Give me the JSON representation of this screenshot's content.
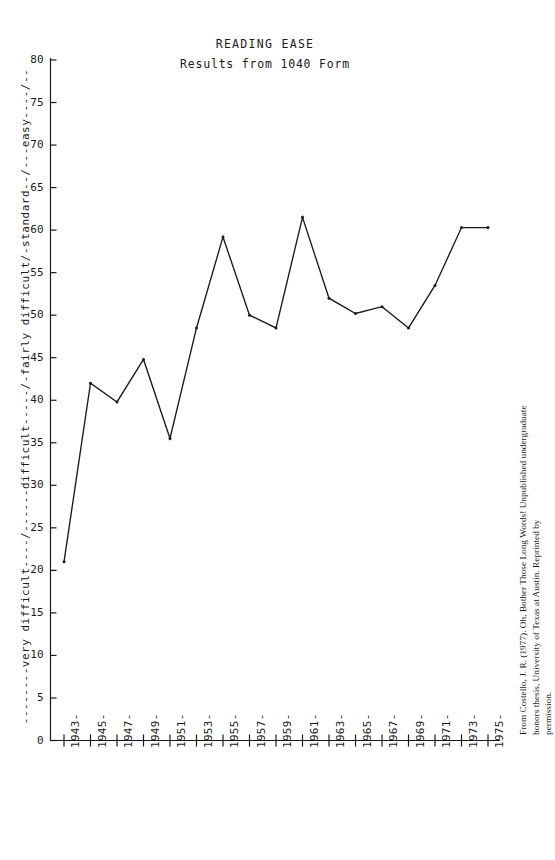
{
  "figure": {
    "title": "READING EASE",
    "subtitle": "Results from 1040 Form",
    "ylabel": "--------very difficult----/------difficult-----/-fairly difficult/-standard--/---easy----/--",
    "credit_line1": "From Costello, J. R. (1977). Oh, Bother Those Long Words! Unpublished undergraduate honors thesis, University of Texas at Austin. Reprinted by",
    "credit_line2": "permission.",
    "line_color": "#1a1a1a",
    "background_color": "#ffffff"
  },
  "chart_data": {
    "type": "line",
    "title": "READING EASE",
    "subtitle": "Results from 1040 Form",
    "xlabel": "",
    "ylabel": "--------very difficult----/------difficult-----/-fairly difficult/-standard--/---easy----/--",
    "xlim": [
      1943,
      1975
    ],
    "ylim": [
      0,
      80
    ],
    "yticks": [
      0,
      5,
      10,
      15,
      20,
      25,
      30,
      35,
      40,
      45,
      50,
      55,
      60,
      65,
      70,
      75,
      80
    ],
    "xticks": [
      "1943-",
      "1945-",
      "1947-",
      "1949-",
      "1951-",
      "1953-",
      "1955-",
      "1957-",
      "1959-",
      "1961-",
      "1963-",
      "1965-",
      "1967-",
      "1969-",
      "1971-",
      "1973-",
      "1975-"
    ],
    "x": [
      1943,
      1945,
      1947,
      1949,
      1951,
      1953,
      1955,
      1957,
      1959,
      1961,
      1963,
      1965,
      1967,
      1969,
      1971,
      1973,
      1975
    ],
    "values": [
      21.0,
      42.0,
      39.8,
      44.8,
      35.5,
      48.5,
      59.2,
      50.0,
      48.5,
      61.5,
      52.0,
      50.2,
      51.0,
      48.5,
      53.5,
      60.3,
      60.3
    ],
    "series": [
      {
        "name": "Reading ease of 1040 Form",
        "points": [
          {
            "year": "1943",
            "value": 21.0
          },
          {
            "year": "1945",
            "value": 42.0
          },
          {
            "year": "1947",
            "value": 39.8
          },
          {
            "year": "1949",
            "value": 44.8
          },
          {
            "year": "1951",
            "value": 35.5
          },
          {
            "year": "1953",
            "value": 48.5
          },
          {
            "year": "1955",
            "value": 59.2
          },
          {
            "year": "1957",
            "value": 50.0
          },
          {
            "year": "1959",
            "value": 48.5
          },
          {
            "year": "1961",
            "value": 61.5
          },
          {
            "year": "1963",
            "value": 52.0
          },
          {
            "year": "1965",
            "value": 50.2
          },
          {
            "year": "1967",
            "value": 51.0
          },
          {
            "year": "1969",
            "value": 48.5
          },
          {
            "year": "1971",
            "value": 53.5
          },
          {
            "year": "1973",
            "value": 60.3
          }
        ]
      }
    ],
    "grid": false,
    "legend": "none",
    "markers": true
  }
}
